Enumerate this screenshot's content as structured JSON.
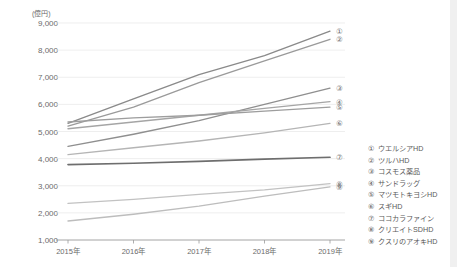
{
  "chart_data": {
    "type": "line",
    "title": "",
    "subtitle": "",
    "xlabel": "",
    "ylabel": "",
    "unit_label": "(億円)",
    "x": [
      "2015年",
      "2016年",
      "2017年",
      "2018年",
      "2019年"
    ],
    "categories": [
      "2015年",
      "2016年",
      "2017年",
      "2018年",
      "2019年"
    ],
    "ylim": [
      1000,
      9000
    ],
    "yticks": [
      1000,
      2000,
      3000,
      4000,
      5000,
      6000,
      7000,
      8000,
      9000
    ],
    "ytick_labels": [
      "1,000",
      "2,000",
      "3,000",
      "4,000",
      "5,000",
      "6,000",
      "7,000",
      "8,000",
      "9,000"
    ],
    "grid": true,
    "legend_position": "right",
    "series": [
      {
        "name": "ウエルシアHD",
        "marker": "①",
        "color": "#8a8a8a",
        "values": [
          5300,
          6200,
          7100,
          7800,
          8700
        ]
      },
      {
        "name": "ツルハHD",
        "marker": "②",
        "color": "#9a9a9a",
        "values": [
          5200,
          5900,
          6800,
          7600,
          8400
        ]
      },
      {
        "name": "コスモス薬品",
        "marker": "③",
        "color": "#8f8f8f",
        "values": [
          4450,
          4900,
          5400,
          6000,
          6600
        ]
      },
      {
        "name": "サンドラッグ",
        "marker": "④",
        "color": "#a5a5a5",
        "values": [
          5100,
          5350,
          5600,
          5850,
          6100
        ]
      },
      {
        "name": "マツモトキヨシHD",
        "marker": "⑤",
        "color": "#9d9d9d",
        "values": [
          5350,
          5500,
          5600,
          5750,
          5900
        ]
      },
      {
        "name": "スギHD",
        "marker": "⑥",
        "color": "#b5b5b5",
        "values": [
          4150,
          4400,
          4650,
          4950,
          5300
        ]
      },
      {
        "name": "ココカラファイン",
        "marker": "⑦",
        "color": "#6e6e6e",
        "values": [
          3780,
          3830,
          3900,
          3980,
          4050
        ]
      },
      {
        "name": "クリエイトSDHD",
        "marker": "⑧",
        "color": "#c2c2c2",
        "values": [
          2350,
          2500,
          2680,
          2850,
          3080
        ]
      },
      {
        "name": "クスリのアオキHD",
        "marker": "⑨",
        "color": "#bdbdbd",
        "values": [
          1700,
          1950,
          2250,
          2620,
          2960
        ]
      }
    ],
    "legend": [
      {
        "num": "①",
        "label": "ウエルシアHD"
      },
      {
        "num": "②",
        "label": "ツルハHD"
      },
      {
        "num": "③",
        "label": "コスモス薬品"
      },
      {
        "num": "④",
        "label": "サンドラッグ"
      },
      {
        "num": "⑤",
        "label": "マツモトキヨシHD"
      },
      {
        "num": "⑥",
        "label": "スギHD"
      },
      {
        "num": "⑦",
        "label": "ココカラファイン"
      },
      {
        "num": "⑧",
        "label": "クリエイトSDHD"
      },
      {
        "num": "⑨",
        "label": "クスリのアオキHD"
      }
    ],
    "end_markers": [
      {
        "num": "①",
        "value": 8700
      },
      {
        "num": "②",
        "value": 8400
      },
      {
        "num": "③",
        "value": 6600
      },
      {
        "num": "④",
        "value": 6100
      },
      {
        "num": "⑤",
        "value": 5900
      },
      {
        "num": "⑥",
        "value": 5300
      },
      {
        "num": "⑦",
        "value": 4050
      },
      {
        "num": "⑧",
        "value": 3080
      },
      {
        "num": "⑨",
        "value": 2960
      }
    ]
  }
}
